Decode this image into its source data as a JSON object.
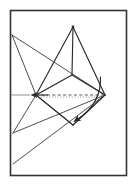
{
  "figure": {
    "title": "",
    "caption": "",
    "colors": {
      "stroke": "#2b2b2b",
      "frame": "#333333",
      "dashed_axis": "#555555",
      "axis_stub": "#9a9a9a",
      "background": "#ffffff"
    },
    "stroke_widths": {
      "frame": 1.6,
      "edge": 1.1,
      "thin_edge": 0.9,
      "dashed": 0.9,
      "arrow": 1.2
    },
    "frame": {
      "x": 10.5,
      "y": 10.5,
      "width": 116,
      "height": 165
    },
    "labels": []
  },
  "chart_data": {
    "type": "diagram",
    "title": "",
    "xlabel": "",
    "ylabel": "",
    "points": {
      "apex_top": [
        73,
        27
      ],
      "rhombus_left": [
        36,
        95
      ],
      "rhombus_top": [
        72,
        75
      ],
      "rhombus_right": [
        105,
        95
      ],
      "rhombus_bottom": [
        73,
        125
      ],
      "left_border_upper": [
        12,
        35
      ],
      "left_border_lower": [
        13,
        133
      ],
      "left_border_mid": [
        12,
        100
      ],
      "bottom_left_far": [
        13,
        164
      ],
      "inner_mid": [
        58,
        68
      ]
    },
    "elements": [
      {
        "name": "upper-tetra-left-edge",
        "type": "line",
        "from": [
          73,
          27
        ],
        "to": [
          36,
          95
        ]
      },
      {
        "name": "upper-tetra-right-edge",
        "type": "line",
        "from": [
          73,
          27
        ],
        "to": [
          105,
          95
        ]
      },
      {
        "name": "upper-tetra-vertical-edge",
        "type": "line",
        "from": [
          73,
          27
        ],
        "to": [
          72,
          75
        ]
      },
      {
        "name": "rhombus-upper-left",
        "type": "line",
        "from": [
          36,
          95
        ],
        "to": [
          72,
          75
        ]
      },
      {
        "name": "rhombus-upper-right",
        "type": "line",
        "from": [
          72,
          75
        ],
        "to": [
          105,
          95
        ]
      },
      {
        "name": "rhombus-lower-left",
        "type": "line",
        "from": [
          36,
          95
        ],
        "to": [
          73,
          125
        ]
      },
      {
        "name": "rhombus-lower-right",
        "type": "line",
        "from": [
          73,
          125
        ],
        "to": [
          105,
          95
        ]
      },
      {
        "name": "rotated-tetra-upper-left-edge",
        "type": "line",
        "from": [
          12,
          35
        ],
        "to": [
          105,
          95
        ]
      },
      {
        "name": "rotated-tetra-left-edge-down",
        "type": "line",
        "from": [
          12,
          35
        ],
        "to": [
          36,
          95
        ]
      },
      {
        "name": "rotated-tetra-left-lower-edge",
        "type": "line",
        "from": [
          13,
          133
        ],
        "to": [
          36,
          95
        ]
      },
      {
        "name": "rotated-tetra-bottom-edge",
        "type": "line",
        "from": [
          13,
          133
        ],
        "to": [
          105,
          95
        ]
      },
      {
        "name": "rotated-tetra-long-edge",
        "type": "line",
        "from": [
          13,
          164
        ],
        "to": [
          105,
          95
        ]
      },
      {
        "name": "rotation-axis-dashed",
        "type": "dashed-line",
        "from": [
          36,
          95
        ],
        "to": [
          105,
          95
        ]
      },
      {
        "name": "rotation-axis-stub",
        "type": "solid-line",
        "from": [
          11,
          95
        ],
        "to": [
          30,
          95
        ]
      },
      {
        "name": "axis-arrow-left",
        "type": "arrow",
        "from": [
          48,
          95
        ],
        "to": [
          34,
          95
        ]
      },
      {
        "name": "rotation-arc-arrow",
        "type": "curved-arrow",
        "from": [
          101,
          78
        ],
        "to": [
          73,
          124
        ]
      }
    ]
  }
}
